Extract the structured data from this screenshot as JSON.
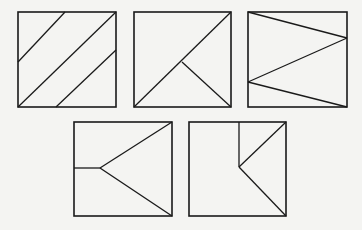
{
  "figure": {
    "stroke_color": "#1a1a1a",
    "background": "#f4f4f2",
    "squares": [
      {
        "id": "square-1",
        "x": 18,
        "y": 12,
        "w": 98,
        "h": 95,
        "lines": [
          [
            18,
            62,
            65,
            12
          ],
          [
            18,
            107,
            116,
            12
          ],
          [
            56,
            107,
            116,
            50
          ]
        ]
      },
      {
        "id": "square-2",
        "x": 134,
        "y": 12,
        "w": 97,
        "h": 95,
        "lines": [
          [
            134,
            107,
            231,
            12
          ],
          [
            182,
            62,
            231,
            107
          ]
        ]
      },
      {
        "id": "square-3",
        "x": 248,
        "y": 12,
        "w": 99,
        "h": 95,
        "lines": [
          [
            248,
            12,
            347,
            38
          ],
          [
            347,
            38,
            248,
            82
          ],
          [
            248,
            82,
            347,
            107
          ]
        ]
      },
      {
        "id": "square-4",
        "x": 74,
        "y": 122,
        "w": 98,
        "h": 94,
        "lines": [
          [
            74,
            168,
            100,
            168
          ],
          [
            100,
            168,
            172,
            122
          ],
          [
            100,
            168,
            172,
            216
          ]
        ]
      },
      {
        "id": "square-5",
        "x": 189,
        "y": 122,
        "w": 97,
        "h": 94,
        "lines": [
          [
            239,
            122,
            239,
            167
          ],
          [
            239,
            167,
            286,
            122
          ],
          [
            239,
            167,
            286,
            216
          ]
        ]
      }
    ]
  }
}
